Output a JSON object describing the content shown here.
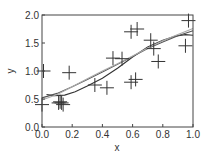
{
  "chart_data": {
    "type": "scatter",
    "title": "",
    "xlabel": "x",
    "ylabel": "y",
    "xlim": [
      0.0,
      1.0
    ],
    "ylim": [
      0.0,
      2.0
    ],
    "grid": false,
    "legend": null,
    "x_ticks": [
      "0.0",
      "0.2",
      "0.4",
      "0.6",
      "0.8",
      "1.0"
    ],
    "y_ticks": [
      "0.0",
      "0.5",
      "1.0",
      "1.5",
      "2.0"
    ],
    "marker": "plus",
    "points": [
      {
        "x": 0.0,
        "y": 0.4
      },
      {
        "x": 0.01,
        "y": 1.0
      },
      {
        "x": 0.11,
        "y": 0.43
      },
      {
        "x": 0.12,
        "y": 0.45
      },
      {
        "x": 0.13,
        "y": 0.43
      },
      {
        "x": 0.14,
        "y": 0.4
      },
      {
        "x": 0.18,
        "y": 0.97
      },
      {
        "x": 0.35,
        "y": 0.75
      },
      {
        "x": 0.43,
        "y": 0.7
      },
      {
        "x": 0.47,
        "y": 1.23
      },
      {
        "x": 0.53,
        "y": 1.22
      },
      {
        "x": 0.59,
        "y": 1.7
      },
      {
        "x": 0.59,
        "y": 0.8
      },
      {
        "x": 0.62,
        "y": 0.85
      },
      {
        "x": 0.63,
        "y": 1.75
      },
      {
        "x": 0.72,
        "y": 1.55
      },
      {
        "x": 0.74,
        "y": 1.4
      },
      {
        "x": 0.77,
        "y": 1.17
      },
      {
        "x": 0.95,
        "y": 1.45
      },
      {
        "x": 0.97,
        "y": 1.9
      }
    ],
    "series": [
      {
        "name": "fit-wavy",
        "color": "#333333",
        "x": [
          0.03,
          0.08,
          0.15,
          0.22,
          0.3,
          0.4,
          0.5,
          0.6,
          0.7,
          0.8,
          0.88,
          0.95,
          1.0
        ],
        "y": [
          0.58,
          0.56,
          0.57,
          0.63,
          0.73,
          0.87,
          1.05,
          1.25,
          1.43,
          1.55,
          1.62,
          1.65,
          1.64
        ]
      },
      {
        "name": "fit-smooth",
        "color": "#555555",
        "x": [
          0.0,
          0.1,
          0.2,
          0.3,
          0.4,
          0.5,
          0.6,
          0.7,
          0.8,
          0.9,
          1.0
        ],
        "y": [
          0.52,
          0.6,
          0.72,
          0.85,
          0.98,
          1.12,
          1.26,
          1.4,
          1.52,
          1.63,
          1.72
        ]
      },
      {
        "name": "true-function",
        "color": "#aaaaaa",
        "x": [
          0.0,
          0.1,
          0.2,
          0.3,
          0.4,
          0.5,
          0.6,
          0.7,
          0.8,
          0.9,
          1.0
        ],
        "y": [
          0.48,
          0.58,
          0.72,
          0.86,
          1.0,
          1.13,
          1.27,
          1.41,
          1.54,
          1.65,
          1.76
        ]
      }
    ]
  }
}
